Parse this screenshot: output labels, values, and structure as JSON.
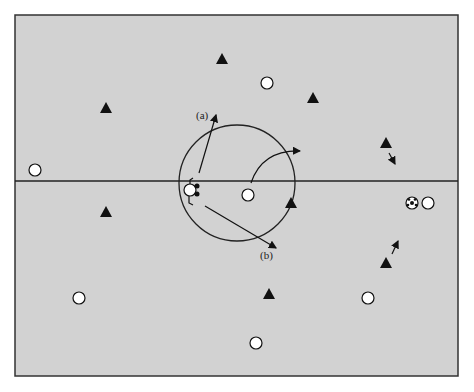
{
  "diagram": {
    "type": "soccer-field-positions",
    "field": {
      "x": 15,
      "y": 15,
      "w": 443,
      "h": 361,
      "fill": "#d2d2d2",
      "stroke": "#333333"
    },
    "midline_y": 181,
    "center_circle": {
      "cx": 237,
      "cy": 183,
      "r": 58
    },
    "labels": {
      "a": "(a)",
      "b": "(b)"
    },
    "team_triangles": [
      {
        "x": 222,
        "y": 59
      },
      {
        "x": 106,
        "y": 108
      },
      {
        "x": 313,
        "y": 98
      },
      {
        "x": 386,
        "y": 143
      },
      {
        "x": 106,
        "y": 212
      },
      {
        "x": 291,
        "y": 203
      },
      {
        "x": 386,
        "y": 263
      },
      {
        "x": 269,
        "y": 294
      }
    ],
    "team_circles": [
      {
        "x": 267,
        "y": 83
      },
      {
        "x": 35,
        "y": 170
      },
      {
        "x": 248,
        "y": 195
      },
      {
        "x": 428,
        "y": 203
      },
      {
        "x": 79,
        "y": 298
      },
      {
        "x": 368,
        "y": 298
      },
      {
        "x": 256,
        "y": 343
      }
    ],
    "ball": {
      "x": 412,
      "y": 203
    },
    "ball_carrier": {
      "x": 190,
      "y": 190
    }
  }
}
